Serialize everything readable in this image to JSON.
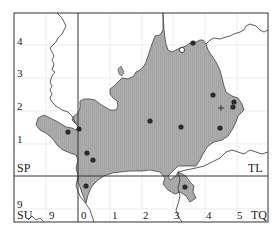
{
  "map": {
    "title": "",
    "colors": {
      "background": "#ffffff",
      "region_fill": "#a9a9a9",
      "region_hatch": "#959595",
      "frame": "#333333",
      "grid": "#e2e2e2",
      "boundary": "#222222",
      "dot": "#2a2a2a"
    },
    "grid_squares": {
      "top_left": "SP",
      "top_right": "TL",
      "bottom_left": "SU",
      "bottom_right": "TQ"
    },
    "northing_labels": {
      "n4": "4",
      "n3": "3",
      "n2": "2",
      "n1": "1",
      "n9": "9"
    },
    "easting_labels": {
      "e9": "9",
      "e0": "0",
      "e1": "1",
      "e2": "2",
      "e3": "3",
      "e4": "4",
      "e5": "5"
    },
    "records": [
      {
        "type": "filled-dot",
        "x": 193,
        "y": 43
      },
      {
        "type": "open-circle",
        "x": 182,
        "y": 50
      },
      {
        "type": "filled-dot",
        "x": 213,
        "y": 95
      },
      {
        "type": "filled-dot",
        "x": 234,
        "y": 102
      },
      {
        "type": "filled-dot",
        "x": 233,
        "y": 107
      },
      {
        "type": "cross",
        "x": 221,
        "y": 108
      },
      {
        "type": "filled-dot",
        "x": 150,
        "y": 121
      },
      {
        "type": "filled-dot",
        "x": 181,
        "y": 127
      },
      {
        "type": "filled-dot",
        "x": 220,
        "y": 128
      },
      {
        "type": "filled-dot",
        "x": 68,
        "y": 132
      },
      {
        "type": "filled-dot",
        "x": 79,
        "y": 129
      },
      {
        "type": "filled-dot",
        "x": 87,
        "y": 153
      },
      {
        "type": "filled-dot",
        "x": 93,
        "y": 160
      },
      {
        "type": "filled-dot",
        "x": 86,
        "y": 186
      },
      {
        "type": "filled-dot",
        "x": 185,
        "y": 187
      }
    ]
  }
}
